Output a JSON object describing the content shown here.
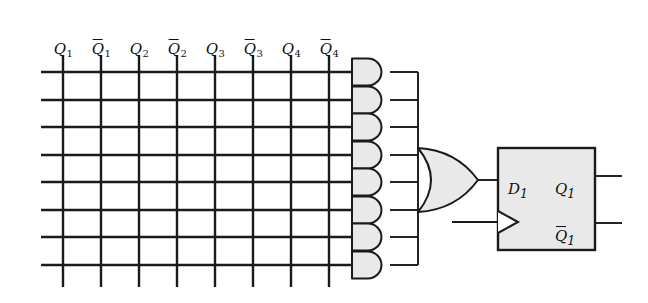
{
  "figure": {
    "kind": "pla-logic-diagram",
    "background_color": "#ffffff",
    "line_color": "#1a1a1a",
    "gate_fill_color": "#e9e9e9"
  },
  "inputs": {
    "columns": [
      {
        "name": "Q1",
        "base": "Q",
        "sub": "1",
        "overbar": false,
        "x": 63
      },
      {
        "name": "Q1bar",
        "base": "Q",
        "sub": "1",
        "overbar": true,
        "x": 101
      },
      {
        "name": "Q2",
        "base": "Q",
        "sub": "2",
        "overbar": false,
        "x": 139
      },
      {
        "name": "Q2bar",
        "base": "Q",
        "sub": "2",
        "overbar": true,
        "x": 177
      },
      {
        "name": "Q3",
        "base": "Q",
        "sub": "3",
        "overbar": false,
        "x": 215
      },
      {
        "name": "Q3bar",
        "base": "Q",
        "sub": "3",
        "overbar": true,
        "x": 253
      },
      {
        "name": "Q4",
        "base": "Q",
        "sub": "4",
        "overbar": false,
        "x": 291
      },
      {
        "name": "Q4bar",
        "base": "Q",
        "sub": "4",
        "overbar": true,
        "x": 329
      }
    ],
    "label_y": 42,
    "vertical_line_top": 56,
    "vertical_line_bottom": 287
  },
  "grid": {
    "row_count": 8,
    "column_count": 8,
    "row_x_start": 41,
    "row_x_end": 352,
    "rows_y": [
      72,
      100,
      127,
      155,
      182,
      210,
      237,
      265
    ]
  },
  "and_gates": {
    "count": 8,
    "x_left": 352,
    "x_right": 390,
    "output_x": 418,
    "gates_y_center": [
      72,
      100,
      127,
      155,
      182,
      210,
      237,
      265
    ],
    "height": 27
  },
  "or_gate": {
    "x_left": 418,
    "x_right": 478,
    "y_top": 148,
    "y_bottom": 212,
    "output_y": 180,
    "output_x_end": 498
  },
  "flip_flop": {
    "x_left": 498,
    "x_right": 595,
    "y_top": 148,
    "y_bottom": 250,
    "input_label": {
      "base": "D",
      "sub": "1",
      "overbar": false,
      "x": 508,
      "y": 182
    },
    "output_labels": [
      {
        "base": "Q",
        "sub": "1",
        "overbar": false,
        "x": 555,
        "y": 182
      },
      {
        "base": "Q",
        "sub": "1",
        "overbar": true,
        "x": 555,
        "y": 229
      }
    ],
    "clock_input_y": 222,
    "clock_wire_x_start": 452,
    "output_stub_x_end": 622,
    "output_stub_y": [
      176,
      223
    ]
  }
}
